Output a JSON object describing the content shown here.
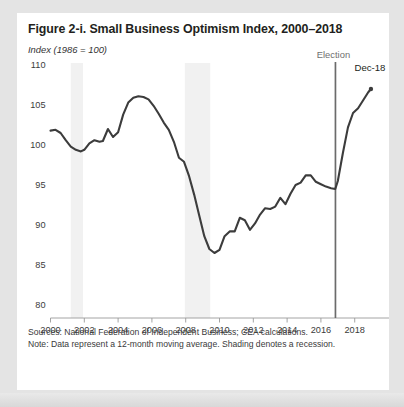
{
  "figure": {
    "title": "Figure 2-i. Small Business Optimism Index, 2000–2018",
    "subtitle": "Index (1986 = 100)",
    "source_note": "Sources: National Federation of Independent Business; CEA calculations.",
    "data_note": "Note: Data represent a 12-month moving average. Shading denotes a recession."
  },
  "colors": {
    "line": "#3c3c3c",
    "election_line": "#6b6b6b",
    "recession_band": "#f1f1f1",
    "text": "#231f20",
    "axis": "#9a9a9a",
    "card_background": "#ffffff",
    "page_background": "#e4e4e4"
  },
  "chart_data": {
    "type": "line",
    "title": "Figure 2-i. Small Business Optimism Index, 2000–2018",
    "subtitle": "Index (1986 = 100)",
    "xlabel": "",
    "ylabel": "Index (1986 = 100)",
    "xlim": [
      2000,
      2019.2
    ],
    "ylim": [
      80,
      110
    ],
    "yticks": [
      80,
      85,
      90,
      95,
      100,
      105,
      110
    ],
    "xticks": [
      2000,
      2002,
      2004,
      2006,
      2008,
      2010,
      2012,
      2014,
      2016,
      2018
    ],
    "grid": false,
    "legend": null,
    "series": [
      {
        "name": "Small Business Optimism Index (12-month moving average)",
        "x": [
          2000.0,
          2000.3,
          2000.6,
          2000.9,
          2001.2,
          2001.5,
          2001.8,
          2002.0,
          2002.3,
          2002.6,
          2002.9,
          2003.1,
          2003.4,
          2003.7,
          2004.0,
          2004.3,
          2004.6,
          2004.9,
          2005.2,
          2005.5,
          2005.8,
          2006.1,
          2006.4,
          2006.7,
          2007.0,
          2007.3,
          2007.6,
          2007.9,
          2008.2,
          2008.5,
          2008.8,
          2009.1,
          2009.4,
          2009.7,
          2010.0,
          2010.3,
          2010.6,
          2010.9,
          2011.2,
          2011.5,
          2011.8,
          2012.1,
          2012.4,
          2012.7,
          2013.0,
          2013.3,
          2013.6,
          2013.9,
          2014.2,
          2014.5,
          2014.8,
          2015.1,
          2015.4,
          2015.7,
          2016.0,
          2016.3,
          2016.6,
          2016.85,
          2017.0,
          2017.3,
          2017.6,
          2017.9,
          2018.2,
          2018.5,
          2018.8,
          2018.96
        ],
        "y": [
          101.8,
          101.9,
          101.5,
          100.6,
          99.8,
          99.4,
          99.2,
          99.4,
          100.2,
          100.6,
          100.4,
          100.5,
          102.0,
          101.0,
          101.6,
          103.8,
          105.3,
          105.9,
          106.1,
          106.0,
          105.7,
          104.9,
          103.9,
          102.8,
          101.9,
          100.4,
          98.4,
          97.9,
          96.1,
          93.8,
          91.2,
          88.6,
          87.0,
          86.5,
          86.9,
          88.6,
          89.2,
          89.2,
          90.9,
          90.6,
          89.4,
          90.2,
          91.3,
          92.1,
          92.0,
          92.3,
          93.4,
          92.6,
          93.9,
          95.0,
          95.3,
          96.2,
          96.2,
          95.4,
          95.1,
          94.8,
          94.6,
          94.5,
          95.5,
          99.0,
          102.2,
          104.0,
          104.6,
          105.6,
          106.6,
          107.0
        ],
        "endpoint_label": "Dec-18"
      }
    ],
    "annotations": [
      {
        "label": "Election",
        "x": 2016.86,
        "type": "vertical-line"
      },
      {
        "label": "Dec-18",
        "x": 2018.96,
        "y": 107.0,
        "type": "endpoint-marker"
      }
    ],
    "shaded_regions": [
      {
        "label": "recession",
        "x0": 2001.2,
        "x1": 2001.92
      },
      {
        "label": "recession",
        "x0": 2007.95,
        "x1": 2009.45
      }
    ]
  },
  "axis_labels": {
    "y": [
      "110",
      "105",
      "100",
      "95",
      "90",
      "85",
      "80"
    ],
    "x": [
      "2000",
      "2002",
      "2004",
      "2006",
      "2008",
      "2010",
      "2012",
      "2014",
      "2016",
      "2018"
    ]
  }
}
